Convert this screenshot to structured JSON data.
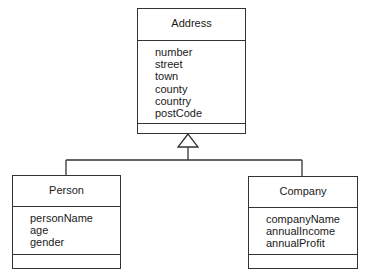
{
  "diagram": {
    "type": "UML class diagram",
    "classes": {
      "address": {
        "name": "Address",
        "attributes": [
          "number",
          "street",
          "town",
          "county",
          "country",
          "postCode"
        ],
        "operations": []
      },
      "person": {
        "name": "Person",
        "attributes": [
          "personName",
          "age",
          "gender"
        ],
        "operations": []
      },
      "company": {
        "name": "Company",
        "attributes": [
          "companyName",
          "annualIncome",
          "annualProfit"
        ],
        "operations": []
      }
    },
    "relationships": [
      {
        "type": "generalization",
        "from": "Person",
        "to": "Address"
      },
      {
        "type": "generalization",
        "from": "Company",
        "to": "Address"
      }
    ],
    "colors": {
      "line": "#333333",
      "background": "#ffffff",
      "text": "#1a1a1a"
    }
  }
}
